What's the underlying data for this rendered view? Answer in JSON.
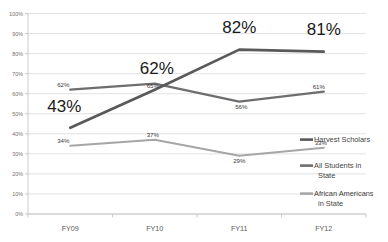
{
  "chart_data": {
    "type": "line",
    "title": "",
    "subtitle": "",
    "xlabel": "",
    "ylabel": "",
    "categories": [
      "FY09",
      "FY10",
      "FY11",
      "FY12"
    ],
    "ylim": [
      0,
      100
    ],
    "yticks": [
      "0%",
      "10%",
      "20%",
      "30%",
      "40%",
      "50%",
      "60%",
      "70%",
      "80%",
      "90%",
      "100%"
    ],
    "ytick_values": [
      0,
      10,
      20,
      30,
      40,
      50,
      60,
      70,
      80,
      90,
      100
    ],
    "grid": true,
    "legend_position": "right",
    "series": [
      {
        "name": "Harvest Scholars",
        "color": "#595959",
        "values": [
          43,
          62,
          82,
          81
        ],
        "labels": [
          "43%",
          "62%",
          "82%",
          "81%"
        ],
        "label_style": "large"
      },
      {
        "name": "All Students in State",
        "color": "#6e6e6e",
        "values": [
          62,
          65,
          56,
          61
        ],
        "labels": [
          "62%",
          "65%",
          "56%",
          "61%"
        ],
        "label_style": "small"
      },
      {
        "name": "African Americans in State",
        "color": "#a6a6a6",
        "values": [
          34,
          37,
          29,
          33
        ],
        "labels": [
          "34%",
          "37%",
          "29%",
          "33%"
        ],
        "label_style": "small"
      }
    ]
  },
  "legend": {
    "items": [
      {
        "label": "Harvest Scholars",
        "color": "#595959"
      },
      {
        "label": "All Students in State",
        "color": "#6e6e6e"
      },
      {
        "label": "African Americans in State",
        "color": "#a6a6a6"
      }
    ]
  },
  "axis": {
    "y_labels": [
      "100%",
      "90%",
      "80%",
      "70%",
      "60%",
      "50%",
      "40%",
      "30%",
      "20%",
      "10%",
      "0%"
    ],
    "x_labels": [
      "FY09",
      "FY10",
      "FY11",
      "FY12"
    ]
  },
  "data_labels": {
    "harvest": {
      "fy09": "43%",
      "fy10": "62%",
      "fy11": "82%",
      "fy12": "81%"
    },
    "all_students": {
      "fy09": "62%",
      "fy10": "65%",
      "fy11": "56%",
      "fy12": "61%"
    },
    "african_americans": {
      "fy09": "34%",
      "fy10": "37%",
      "fy11": "29%",
      "fy12": "33%"
    }
  }
}
